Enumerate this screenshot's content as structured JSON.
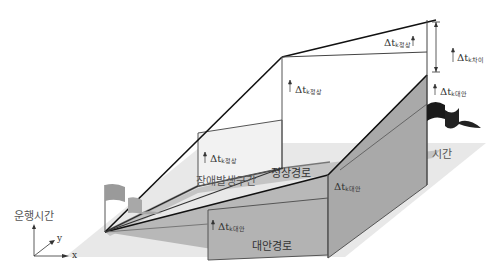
{
  "diagram": {
    "axis_labels": {
      "vertical": "운행시간",
      "y": "y",
      "x": "x",
      "time": "시간"
    },
    "regions": {
      "failure_section": "장애발생구간",
      "normal_route": "정상경로",
      "alternative_route": "대안경로"
    },
    "deltas": {
      "normal_mid": {
        "symbol": "Δt",
        "sub": "k정상"
      },
      "normal_low": {
        "symbol": "Δt",
        "sub": "k정상"
      },
      "normal_top": {
        "symbol": "Δt",
        "sub": "k정상"
      },
      "difference": {
        "symbol": "Δt",
        "sub": "k차이"
      },
      "alt_right": {
        "symbol": "Δt",
        "sub": "k대안"
      },
      "alt_corner": {
        "symbol": "Δt",
        "sub": "k대안"
      },
      "alt_low": {
        "symbol": "Δt",
        "sub": "k대안"
      }
    },
    "colors": {
      "ground": "#e6e6e6",
      "route_band": "#bdbdbd",
      "alt_box": "#b0b0b0",
      "flag_start": "#9a9a9a",
      "flag_end": "#1a1a1a",
      "line": "#222222"
    }
  }
}
